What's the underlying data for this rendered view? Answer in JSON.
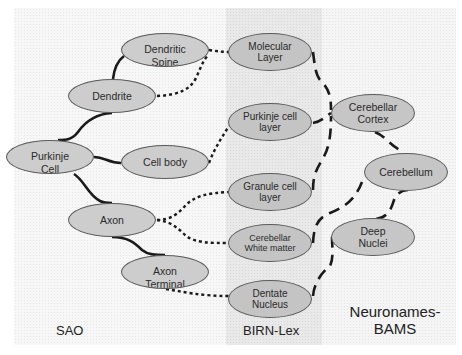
{
  "panels": {
    "sao": {
      "label": "SAO",
      "background": "#f7f7f7"
    },
    "birn": {
      "label": "BIRN-Lex",
      "background": "#e9e9e9"
    },
    "bams": {
      "label": "Neuronames-\nBAMS",
      "background": "#f5f5f5"
    }
  },
  "nodes": {
    "dendritic_spine": {
      "label": "Dendritic\nSpine",
      "panel": "sao"
    },
    "dendrite": {
      "label": "Dendrite",
      "panel": "sao"
    },
    "purkinje_cell": {
      "label": "Purkinje\nCell",
      "panel": "sao"
    },
    "cell_body": {
      "label": "Cell body",
      "panel": "sao"
    },
    "axon": {
      "label": "Axon",
      "panel": "sao"
    },
    "axon_terminal": {
      "label": "Axon\nTerminal",
      "panel": "sao"
    },
    "molecular_layer": {
      "label": "Molecular\nLayer",
      "panel": "birn"
    },
    "purkinje_cell_layer": {
      "label": "Purkinje cell\nlayer",
      "panel": "birn"
    },
    "granule_cell_layer": {
      "label": "Granule cell\nlayer",
      "panel": "birn"
    },
    "cerebellar_white_matter": {
      "label": "Cerebellar\nWhite matter",
      "panel": "birn"
    },
    "dentate_nucleus": {
      "label": "Dentate\nNucleus",
      "panel": "birn"
    },
    "cerebellar_cortex": {
      "label": "Cerebellar\nCortex",
      "panel": "bams"
    },
    "cerebellum": {
      "label": "Cerebellum",
      "panel": "bams"
    },
    "deep_nuclei": {
      "label": "Deep\nNuclei",
      "panel": "bams"
    }
  },
  "edges": {
    "solid_partof": [
      [
        "dendritic_spine",
        "dendrite"
      ],
      [
        "dendrite",
        "purkinje_cell"
      ],
      [
        "cell_body",
        "purkinje_cell"
      ],
      [
        "axon",
        "purkinje_cell"
      ],
      [
        "axon_terminal",
        "axon"
      ]
    ],
    "dotted_located_in": [
      [
        "dendritic_spine",
        "molecular_layer"
      ],
      [
        "dendrite",
        "molecular_layer"
      ],
      [
        "cell_body",
        "purkinje_cell_layer"
      ],
      [
        "axon",
        "granule_cell_layer"
      ],
      [
        "axon",
        "cerebellar_white_matter"
      ],
      [
        "axon_terminal",
        "dentate_nucleus"
      ]
    ],
    "dashed_mapping": [
      [
        "molecular_layer",
        "cerebellar_cortex"
      ],
      [
        "purkinje_cell_layer",
        "cerebellar_cortex"
      ],
      [
        "granule_cell_layer",
        "cerebellar_cortex"
      ],
      [
        "cerebellar_white_matter",
        "cerebellum"
      ],
      [
        "dentate_nucleus",
        "deep_nuclei"
      ],
      [
        "cerebellar_cortex",
        "cerebellum"
      ],
      [
        "deep_nuclei",
        "cerebellum"
      ]
    ]
  },
  "colors": {
    "node_fill": "#c8c8c8",
    "node_border": "#5a5a5a",
    "edge": "#1a1a1a"
  }
}
